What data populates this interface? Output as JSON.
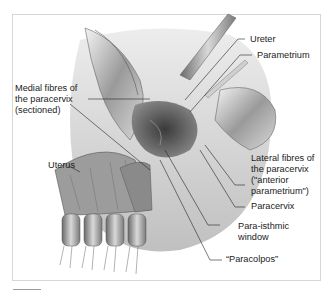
{
  "figure": {
    "labels": {
      "ureter": "Ureter",
      "parametrium": "Parametrium",
      "medial_fibres": "Medial fibres of\nthe paracervix\n(sectioned)",
      "uterus": "Uterus",
      "lateral_fibres": "Lateral fibres of\nthe paracervix\n(\"anterior\nparametrium\")",
      "paracervix": "Paracervix",
      "para_isthmic": "Para-isthmic\nwindow",
      "paracolpos": "“Paracolpos”"
    }
  }
}
